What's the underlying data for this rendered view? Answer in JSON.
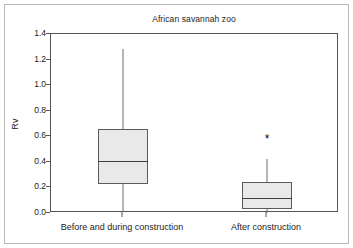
{
  "chart_data": {
    "type": "box",
    "title": "African savannah zoo",
    "xlabel": "",
    "ylabel": "Rv",
    "ylim": [
      0.0,
      1.4
    ],
    "grid": false,
    "legend": null,
    "ytick_labels": [
      "0.0",
      "0.2",
      "0.4",
      "0.6",
      "0.8",
      "1.0",
      "1.2",
      "1.4"
    ],
    "ytick_values": [
      0.0,
      0.2,
      0.4,
      0.6,
      0.8,
      1.0,
      1.2,
      1.4
    ],
    "categories": [
      "Before and during construction",
      "After construction"
    ],
    "boxes": [
      {
        "category": "Before and during construction",
        "whisker_low": 0.005,
        "q1": 0.225,
        "median": 0.41,
        "q3": 0.66,
        "whisker_high": 1.285,
        "outliers": []
      },
      {
        "category": "After construction",
        "whisker_low": 0.0,
        "q1": 0.035,
        "median": 0.12,
        "q3": 0.245,
        "whisker_high": 0.425,
        "outliers": [
          0.6
        ]
      }
    ],
    "outlier_marker": "*",
    "colors": {
      "box_fill": "#e9e9e9",
      "box_edge": "#5b5b5b",
      "median": "#3d3d3d",
      "whisker": "#6d6d6d",
      "axis": "#555555",
      "text": "#1c1c1c",
      "frame": "#b9b9b9",
      "background": "#ffffff"
    }
  }
}
